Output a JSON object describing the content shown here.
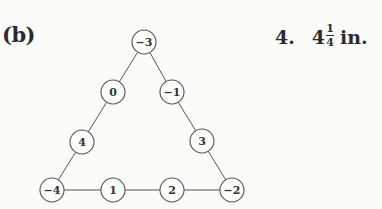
{
  "part_label": "(b)",
  "answer": {
    "number": "4.",
    "whole": "4",
    "numerator": "1",
    "denominator": "4",
    "unit": "in."
  },
  "figure": {
    "nodes": [
      {
        "id": "top",
        "label": "−3",
        "x": 144,
        "y": 42
      },
      {
        "id": "left-upper",
        "label": "0",
        "x": 113,
        "y": 92
      },
      {
        "id": "right-upper",
        "label": "−1",
        "x": 172,
        "y": 92
      },
      {
        "id": "left-lower",
        "label": "4",
        "x": 82,
        "y": 142
      },
      {
        "id": "right-lower",
        "label": "3",
        "x": 202,
        "y": 141
      },
      {
        "id": "bottom-left",
        "label": "−4",
        "x": 52,
        "y": 190
      },
      {
        "id": "bottom-mid-left",
        "label": "1",
        "x": 113,
        "y": 190
      },
      {
        "id": "bottom-mid-right",
        "label": "2",
        "x": 172,
        "y": 190
      },
      {
        "id": "bottom-right",
        "label": "−2",
        "x": 232,
        "y": 190
      }
    ],
    "edges": [
      [
        "top",
        "left-upper"
      ],
      [
        "left-upper",
        "left-lower"
      ],
      [
        "left-lower",
        "bottom-left"
      ],
      [
        "top",
        "right-upper"
      ],
      [
        "right-upper",
        "right-lower"
      ],
      [
        "right-lower",
        "bottom-right"
      ],
      [
        "bottom-left",
        "bottom-mid-left"
      ],
      [
        "bottom-mid-left",
        "bottom-mid-right"
      ],
      [
        "bottom-mid-right",
        "bottom-right"
      ]
    ],
    "node_radius": 12,
    "stroke_color": "#555555"
  }
}
